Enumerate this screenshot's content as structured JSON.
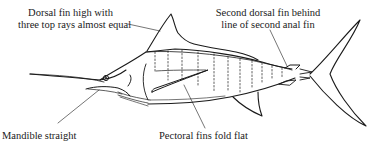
{
  "diagram": {
    "line_color": "#1a1a1a",
    "background": "#ffffff",
    "labels": {
      "dorsal": {
        "line1": "Dorsal fin high with",
        "line2": "three top rays almost equal"
      },
      "second_dorsal": {
        "line1": "Second dorsal fin behind",
        "line2": "line of second anal fin"
      },
      "mandible": {
        "text": "Mandible straight"
      },
      "pectoral": {
        "text": "Pectoral fins fold flat"
      }
    },
    "parts": [
      "bill",
      "eye",
      "mandible",
      "head",
      "dorsal-fin",
      "body",
      "pectoral-fin",
      "anal-fin",
      "second-dorsal-fin",
      "second-anal-fin",
      "caudal-keel",
      "tail-fin"
    ]
  }
}
